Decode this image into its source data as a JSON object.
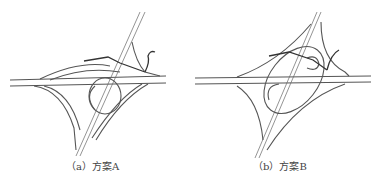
{
  "figure": {
    "panels": [
      {
        "id": "a",
        "caption": "（a）方案A",
        "label": "方案A"
      },
      {
        "id": "b",
        "caption": "（b）方案B",
        "label": "方案B"
      }
    ]
  },
  "colors": {
    "line": "#555555",
    "background": "#ffffff",
    "caption": "#444444"
  }
}
